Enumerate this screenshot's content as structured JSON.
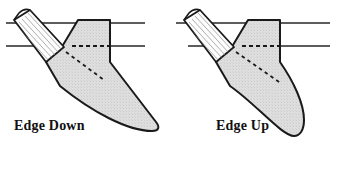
{
  "figure": {
    "background_color": "#ffffff",
    "outline_color": "#1a1a1a",
    "blade_fill_color": "#dedede",
    "handle_fill_color": "#fdfdfd",
    "guide_line_color": "#262626",
    "dashed_line_color": "#1a1a1a"
  },
  "panels": [
    {
      "id": "edge-down",
      "caption": "Edge Down",
      "description": "Chef knife inserted blade-edge downward through a horizontal slot",
      "edge_direction": "down",
      "guide_lines": [
        {
          "name": "upper-guide-line",
          "y": 23
        },
        {
          "name": "lower-guide-line",
          "y": 46
        }
      ],
      "dashed_marks": [
        {
          "name": "horizontal-hidden-edge"
        },
        {
          "name": "diagonal-hidden-edge"
        }
      ]
    },
    {
      "id": "edge-up",
      "caption": "Edge Up",
      "description": "Chef knife inserted blade-edge upward through a horizontal slot",
      "edge_direction": "up",
      "guide_lines": [
        {
          "name": "upper-guide-line",
          "y": 23
        },
        {
          "name": "lower-guide-line",
          "y": 46
        }
      ],
      "dashed_marks": [
        {
          "name": "horizontal-hidden-edge"
        },
        {
          "name": "diagonal-hidden-edge"
        }
      ]
    }
  ]
}
